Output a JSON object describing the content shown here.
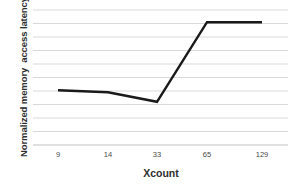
{
  "chart_data": {
    "type": "line",
    "title": "",
    "xlabel": "Xcount",
    "ylabel": "Normalized memory  access latency",
    "categories": [
      "9",
      "14",
      "33",
      "65",
      "129"
    ],
    "values": [
      4.05,
      3.9,
      3.2,
      9.1,
      9.1
    ],
    "series": [
      {
        "name": "Normalized memory access latency",
        "values": [
          4.05,
          3.9,
          3.2,
          9.1,
          9.1
        ],
        "color": "#1a1a1a"
      }
    ],
    "ylim": [
      0,
      10
    ],
    "y_tick_labels": [],
    "y_gridline_count": 10,
    "grid": true,
    "grid_color": "#d9d9d9",
    "legend": "none",
    "axis_line_color": "#bfbfbf"
  },
  "axes": {
    "x_title": "Xcount",
    "y_title": "Normalized memory  access latency",
    "x_ticks": [
      "9",
      "14",
      "33",
      "65",
      "129"
    ]
  }
}
